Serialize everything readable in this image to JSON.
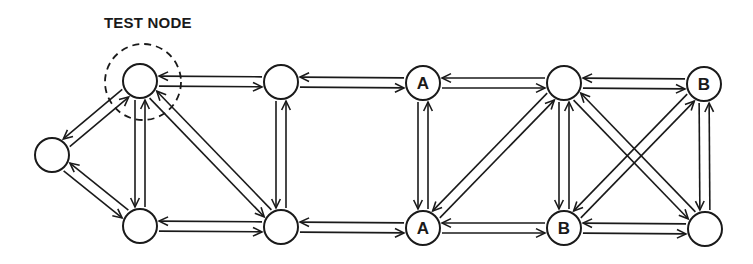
{
  "title": "TEST NODE",
  "colors": {
    "stroke": "#1a1a1a",
    "background": "#ffffff"
  },
  "node_radius": 17,
  "highlight": {
    "node": "n0",
    "cx": 143,
    "cy": 82,
    "r": 38
  },
  "nodes": [
    {
      "id": "L",
      "x": 52,
      "y": 155,
      "label": ""
    },
    {
      "id": "n0",
      "x": 140,
      "y": 81,
      "label": ""
    },
    {
      "id": "n1",
      "x": 140,
      "y": 226,
      "label": ""
    },
    {
      "id": "n2",
      "x": 281,
      "y": 82,
      "label": ""
    },
    {
      "id": "n3",
      "x": 281,
      "y": 227,
      "label": ""
    },
    {
      "id": "A1",
      "x": 423,
      "y": 83,
      "label": "A"
    },
    {
      "id": "A2",
      "x": 423,
      "y": 228,
      "label": "A"
    },
    {
      "id": "n4",
      "x": 564,
      "y": 83,
      "label": ""
    },
    {
      "id": "B1",
      "x": 564,
      "y": 228,
      "label": "B"
    },
    {
      "id": "B2",
      "x": 704,
      "y": 84,
      "label": "B"
    },
    {
      "id": "n5",
      "x": 705,
      "y": 229,
      "label": ""
    }
  ],
  "edges": [
    [
      "L",
      "n0"
    ],
    [
      "L",
      "n1"
    ],
    [
      "n0",
      "n2"
    ],
    [
      "n0",
      "n1"
    ],
    [
      "n0",
      "n3"
    ],
    [
      "n1",
      "n3"
    ],
    [
      "n2",
      "n3"
    ],
    [
      "n2",
      "A1"
    ],
    [
      "n3",
      "A2"
    ],
    [
      "A1",
      "A2"
    ],
    [
      "A1",
      "n4"
    ],
    [
      "A2",
      "B1"
    ],
    [
      "A2",
      "n4"
    ],
    [
      "n4",
      "B1"
    ],
    [
      "n4",
      "B2"
    ],
    [
      "n4",
      "n5"
    ],
    [
      "B1",
      "B2"
    ],
    [
      "B1",
      "n5"
    ],
    [
      "B2",
      "n5"
    ]
  ]
}
